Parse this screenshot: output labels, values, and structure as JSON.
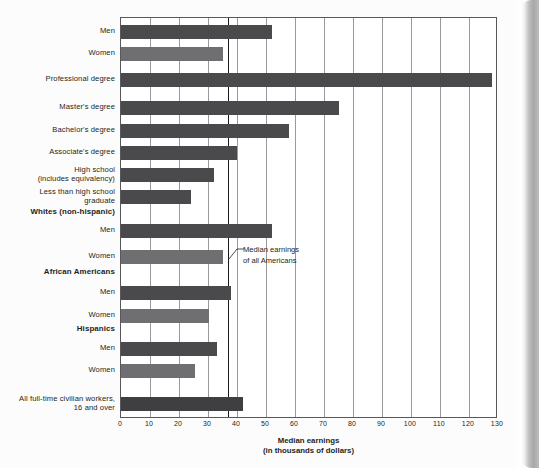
{
  "chart_data": {
    "type": "bar",
    "orientation": "horizontal",
    "title": "",
    "xlabel": "Median earnings (in thousands of dollars)",
    "xlabel_line1": "Median earnings",
    "xlabel_line2": "(in thousands of dollars)",
    "ylabel": "",
    "xlim": [
      0,
      130
    ],
    "xticks": [
      0,
      10,
      20,
      30,
      40,
      50,
      60,
      70,
      80,
      90,
      100,
      110,
      120,
      130
    ],
    "grid": true,
    "grid_axis": "x",
    "legend": "none",
    "units": "thousands of dollars",
    "reference_line": {
      "value": 37,
      "label_line1": "Median earnings",
      "label_line2": "of all Americans"
    },
    "colors": {
      "men": "#4a4a4c",
      "women": "#6f6f72",
      "total": "#3f3f41",
      "gridline": "#9a9a9d",
      "axis": "#58585b",
      "text": "#231f20"
    },
    "categories": [
      "Men",
      "Women",
      "Professional degree",
      "Master's degree",
      "Bachelor's degree",
      "Associate's degree",
      "High school (includes equivalency)",
      "Less than high school graduate",
      "Whites (non-hispanic)",
      "Men",
      "Women",
      "African Americans",
      "Men",
      "Women",
      "Hispanics",
      "Men",
      "Women",
      "All full-time civilian workers, 16 and over"
    ],
    "values": [
      52,
      35,
      128,
      75,
      58,
      40,
      32,
      24,
      null,
      52,
      35,
      null,
      38,
      30.5,
      null,
      33,
      25.5,
      42
    ],
    "rows": [
      {
        "label_line1": "Men",
        "label_line2": "",
        "value": 52,
        "series": "men",
        "is_group": false,
        "top": 24
      },
      {
        "label_line1": "Women",
        "label_line2": "",
        "value": 35,
        "series": "women",
        "is_group": false,
        "top": 46
      },
      {
        "label_line1": "Professional degree",
        "label_line2": "",
        "value": 128,
        "series": "men",
        "is_group": false,
        "top": 72
      },
      {
        "label_line1": "Master's degree",
        "label_line2": "",
        "value": 75,
        "series": "men",
        "is_group": false,
        "top": 100
      },
      {
        "label_line1": "Bachelor's degree",
        "label_line2": "",
        "value": 58,
        "series": "men",
        "is_group": false,
        "top": 123
      },
      {
        "label_line1": "Associate's degree",
        "label_line2": "",
        "value": 40,
        "series": "men",
        "is_group": false,
        "top": 145
      },
      {
        "label_line1": "High school",
        "label_line2": "(includes equivalency)",
        "value": 32,
        "series": "men",
        "is_group": false,
        "top": 167
      },
      {
        "label_line1": "Less than high school",
        "label_line2": "graduate",
        "value": 24,
        "series": "men",
        "is_group": false,
        "top": 189
      },
      {
        "label_line1": "Whites (non-hispanic)",
        "label_line2": "",
        "value": null,
        "series": "group",
        "is_group": true,
        "top": 211
      },
      {
        "label_line1": "Men",
        "label_line2": "",
        "value": 52,
        "series": "men",
        "is_group": false,
        "top": 223
      },
      {
        "label_line1": "Women",
        "label_line2": "",
        "value": 35,
        "series": "women",
        "is_group": false,
        "top": 249
      },
      {
        "label_line1": "African Americans",
        "label_line2": "",
        "value": null,
        "series": "group",
        "is_group": true,
        "top": 271
      },
      {
        "label_line1": "Men",
        "label_line2": "",
        "value": 38,
        "series": "men",
        "is_group": false,
        "top": 285
      },
      {
        "label_line1": "Women",
        "label_line2": "",
        "value": 30.5,
        "series": "women",
        "is_group": false,
        "top": 308
      },
      {
        "label_line1": "Hispanics",
        "label_line2": "",
        "value": null,
        "series": "group",
        "is_group": true,
        "top": 328
      },
      {
        "label_line1": "Men",
        "label_line2": "",
        "value": 33,
        "series": "men",
        "is_group": false,
        "top": 341
      },
      {
        "label_line1": "Women",
        "label_line2": "",
        "value": 25.5,
        "series": "women",
        "is_group": false,
        "top": 363
      },
      {
        "label_line1": "All full-time civilian workers,",
        "label_line2": "16 and over",
        "value": 42,
        "series": "total",
        "is_group": false,
        "top": 396
      }
    ]
  }
}
